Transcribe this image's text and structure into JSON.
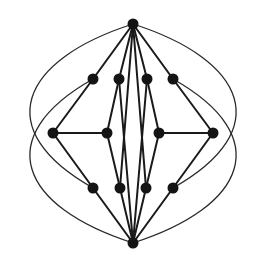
{
  "diagram": {
    "type": "graph",
    "background": "#ffffff",
    "node_color": "#141414",
    "edge_color": "#1a1a1a",
    "node_radius": 5.5,
    "nodes": [
      {
        "id": "top",
        "x": 133,
        "y": 24
      },
      {
        "id": "r2a",
        "x": 93,
        "y": 79
      },
      {
        "id": "r2b",
        "x": 119,
        "y": 79
      },
      {
        "id": "r2c",
        "x": 147,
        "y": 79
      },
      {
        "id": "r2d",
        "x": 173,
        "y": 79
      },
      {
        "id": "r3a",
        "x": 53,
        "y": 133
      },
      {
        "id": "r3b",
        "x": 107,
        "y": 133
      },
      {
        "id": "r3c",
        "x": 159,
        "y": 133
      },
      {
        "id": "r3d",
        "x": 213,
        "y": 133
      },
      {
        "id": "r4a",
        "x": 93,
        "y": 188
      },
      {
        "id": "r4b",
        "x": 120,
        "y": 188
      },
      {
        "id": "r4c",
        "x": 146,
        "y": 188
      },
      {
        "id": "r4d",
        "x": 173,
        "y": 188
      },
      {
        "id": "bottom",
        "x": 133,
        "y": 243
      }
    ],
    "edges": [
      [
        "top",
        "r2a"
      ],
      [
        "top",
        "r2b"
      ],
      [
        "top",
        "r2c"
      ],
      [
        "top",
        "r2d"
      ],
      [
        "top",
        "r4b"
      ],
      [
        "top",
        "r4c"
      ],
      [
        "r2a",
        "r3a"
      ],
      [
        "r2b",
        "r3b"
      ],
      [
        "r2c",
        "r3c"
      ],
      [
        "r2d",
        "r3d"
      ],
      [
        "r2b",
        "bottom"
      ],
      [
        "r2c",
        "bottom"
      ],
      [
        "r3a",
        "r3b"
      ],
      [
        "r3c",
        "r3d"
      ],
      [
        "r3a",
        "r4a"
      ],
      [
        "r3b",
        "r4b"
      ],
      [
        "r3c",
        "r4c"
      ],
      [
        "r3d",
        "r4d"
      ],
      [
        "r4a",
        "bottom"
      ],
      [
        "r4b",
        "bottom"
      ],
      [
        "r4c",
        "bottom"
      ],
      [
        "r4d",
        "bottom"
      ]
    ],
    "curves": [
      {
        "from": "top",
        "to": "r4a",
        "path": "M133,24 C20,60 -10,130 93,188"
      },
      {
        "from": "r2a",
        "to": "bottom",
        "path": "M93,79 C-10,137 20,207 133,243"
      },
      {
        "from": "top",
        "to": "r4d",
        "path": "M133,24 C246,60 276,130 173,188"
      },
      {
        "from": "r2d",
        "to": "bottom",
        "path": "M173,79 C276,137 246,207 133,243"
      }
    ]
  }
}
